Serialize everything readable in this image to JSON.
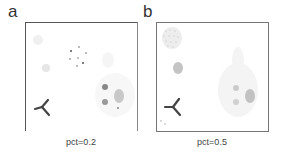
{
  "figure": {
    "panels": [
      {
        "label": "a",
        "caption": "pct=0.2",
        "pct": 0.2
      },
      {
        "label": "b",
        "caption": "pct=0.5",
        "pct": 0.5
      }
    ]
  },
  "colors": {
    "frame": "#555555",
    "points_dark": "#555555",
    "points_light": "#bbbbbb",
    "tripod": "#444444",
    "text": "#333333"
  }
}
